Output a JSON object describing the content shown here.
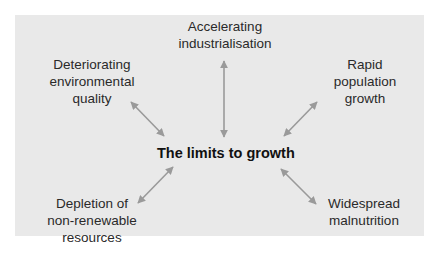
{
  "diagram": {
    "center": "The limits to growth",
    "nodes": [
      {
        "id": "top",
        "label": "Accelerating\nindustrialisation"
      },
      {
        "id": "top-left",
        "label": "Deteriorating\nenvironmental\nquality"
      },
      {
        "id": "top-right",
        "label": "Rapid\npopulation\ngrowth"
      },
      {
        "id": "bottom-left",
        "label": "Depletion of\nnon-renewable\nresources"
      },
      {
        "id": "bottom-right",
        "label": "Widespread\nmalnutrition"
      }
    ],
    "edges": [
      {
        "from": "The limits to growth",
        "to": "Accelerating industrialisation",
        "type": "bidirectional"
      },
      {
        "from": "The limits to growth",
        "to": "Deteriorating environmental quality",
        "type": "bidirectional"
      },
      {
        "from": "The limits to growth",
        "to": "Rapid population growth",
        "type": "bidirectional"
      },
      {
        "from": "The limits to growth",
        "to": "Depletion of non-renewable resources",
        "type": "bidirectional"
      },
      {
        "from": "The limits to growth",
        "to": "Widespread malnutrition",
        "type": "bidirectional"
      }
    ],
    "colors": {
      "background": "#e9e9e9",
      "arrow": "#9a9a9a",
      "text": "#2a2a2a"
    }
  }
}
